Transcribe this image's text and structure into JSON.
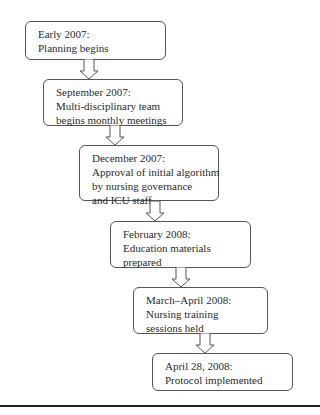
{
  "diagram": {
    "type": "flowchart-timeline",
    "steps": [
      {
        "date": "Early 2007:",
        "lines": [
          "Planning begins"
        ]
      },
      {
        "date": "September 2007:",
        "lines": [
          "Multi-disciplinary team",
          "begins monthly meetings"
        ]
      },
      {
        "date": "December 2007:",
        "lines": [
          "Approval of initial algorithm",
          "by nursing governance",
          "and ICU staff"
        ]
      },
      {
        "date": "February 2008:",
        "lines": [
          "Education materials",
          "prepared"
        ]
      },
      {
        "date": "March–April 2008:",
        "lines": [
          "Nursing training",
          "sessions held"
        ]
      },
      {
        "date": "April 28, 2008:",
        "lines": [
          "Protocol implemented"
        ]
      }
    ],
    "connector": "down-arrow-icon",
    "colors": {
      "border": "#555555",
      "text": "#2a2a2a",
      "rule": "#1e1e1e",
      "background": "#ffffff"
    }
  }
}
